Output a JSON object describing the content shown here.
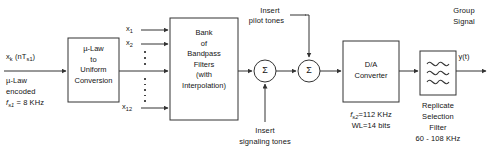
{
  "diagram": {
    "stroke_color": "#333333",
    "text_color": "#141414",
    "background": "#ffffff"
  },
  "input": {
    "signal_label_main": "x",
    "signal_label_sub": "k",
    "signal_label_rest": " (nT",
    "signal_label_sub2": "s1",
    "signal_label_close": ")",
    "note_line1": "µ-Law",
    "note_line2": "encoded",
    "rate_symbol": "f",
    "rate_symbol_sub": "s1",
    "rate_value": " = 8 KHz"
  },
  "blocks": [
    {
      "id": "mu-law-converter",
      "lines": [
        "µ-Law",
        "to",
        "Uniform",
        "Conversion"
      ]
    },
    {
      "id": "bandpass-filter-bank",
      "lines": [
        "Bank",
        "of",
        "Bandpass",
        "Filters",
        "(with",
        "Interpolation)"
      ]
    },
    {
      "id": "da-converter",
      "lines": [
        "D/A",
        "Converter"
      ]
    },
    {
      "id": "replicate-selection-filter",
      "lines": []
    }
  ],
  "channel_inputs": [
    {
      "name": "x",
      "sub": "1"
    },
    {
      "name": "x",
      "sub": "2"
    },
    {
      "name": "x",
      "sub": "12"
    }
  ],
  "summers": [
    {
      "id": "summer-signaling",
      "symbol": "Σ"
    },
    {
      "id": "summer-pilot",
      "symbol": "Σ"
    }
  ],
  "annotations": {
    "pilot_line1": "Insert",
    "pilot_line2": "pilot tones",
    "signaling_line1": "Insert",
    "signaling_line2": "signaling tones"
  },
  "da_converter_notes": {
    "rate_symbol": "f",
    "rate_symbol_sub": "s2",
    "rate_value": "=112 KHz",
    "word_length": "WL=14 bits"
  },
  "filter_notes": {
    "line1": "Replicate",
    "line2": "Selection",
    "line3": "Filter",
    "line4": "60 - 108 KHz"
  },
  "output": {
    "group_line1": "Group",
    "group_line2": "Signal",
    "signal": "y(t)"
  }
}
